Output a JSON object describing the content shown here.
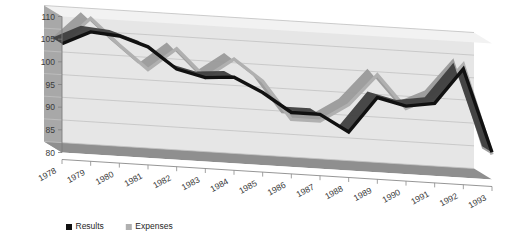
{
  "chart_data": {
    "type": "line",
    "title": "",
    "subtitle": "",
    "xlabel": "",
    "ylabel": "",
    "grid": true,
    "three_d": true,
    "legend_position": "bottom-left",
    "categories": [
      "1978",
      "1979",
      "1980",
      "1981",
      "1982",
      "1983",
      "1984",
      "1985",
      "1986",
      "1987",
      "1988",
      "1989",
      "1990",
      "1991",
      "1992",
      "1993"
    ],
    "x": [
      1978,
      1979,
      1980,
      1981,
      1982,
      1983,
      1984,
      1985,
      1986,
      1987,
      1988,
      1989,
      1990,
      1991,
      1992,
      1993
    ],
    "ylim": [
      80,
      110
    ],
    "yticks": [
      80,
      85,
      90,
      95,
      100,
      105,
      110
    ],
    "ytick_labels": [
      "80",
      "85",
      "90",
      "95",
      "100",
      "105",
      "110"
    ],
    "series": [
      {
        "name": "Results",
        "color": "#111111",
        "values": [
          104.0,
          107.0,
          106.5,
          104.5,
          100.0,
          98.5,
          99.0,
          96.0,
          92.0,
          92.0,
          88.5,
          96.5,
          95.0,
          96.0,
          104.0,
          86.0
        ]
      },
      {
        "name": "Expenses",
        "color": "#b0b0b0",
        "values": [
          104.0,
          110.0,
          104.5,
          99.5,
          104.5,
          98.5,
          103.0,
          98.5,
          90.5,
          90.5,
          94.5,
          101.5,
          94.5,
          97.5,
          105.0,
          85.5
        ]
      }
    ]
  },
  "legend": {
    "items": [
      {
        "label": "Results",
        "swatch_color": "#111111"
      },
      {
        "label": "Expenses",
        "swatch_color": "#b0b0b0"
      }
    ]
  },
  "colors": {
    "background": "#ffffff",
    "back_wall": "#e6e6e6",
    "back_wall_top": "#f2f2f2",
    "side_wall": "#a8a8a8",
    "floor": "#8f8f8f",
    "floor_top": "#d8d8d8",
    "gridline": "#c2c2c2",
    "axis_text": "#3a3a3a",
    "results": "#111111",
    "expenses": "#b0b0b0"
  }
}
